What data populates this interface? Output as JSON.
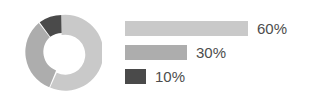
{
  "chart_data": {
    "type": "pie",
    "title": "",
    "subtitle": "",
    "variant": "donut",
    "categories": [
      "60%",
      "30%",
      "10%"
    ],
    "values": [
      60,
      30,
      10
    ],
    "labels": [
      "60%",
      "30%",
      "10%"
    ],
    "colors": [
      "#c9c9c9",
      "#adadad",
      "#4a4a4a"
    ],
    "legend_position": "right",
    "legend_style": "proportional-bars",
    "grid": false,
    "xlabel": "",
    "ylabel": "",
    "slice_gap": true,
    "gap_color": "#ffffff",
    "inner_radius_ratio": 0.52,
    "start_angle_deg": 0,
    "direction": "counterclockwise"
  },
  "figure": {
    "background": "#ffffff",
    "donut": {
      "center_x": 40,
      "center_y": 40,
      "outer_radius": 38,
      "inner_radius": 20,
      "slices": [
        {
          "name": "slice-60",
          "value": 60,
          "label": "60%",
          "color": "#c9c9c9"
        },
        {
          "name": "slice-30",
          "value": 30,
          "label": "30%",
          "color": "#adadad"
        },
        {
          "name": "slice-10",
          "value": 10,
          "label": "10%",
          "color": "#4a4a4a"
        }
      ]
    },
    "legend": {
      "max_bar_width": 123,
      "rows": [
        {
          "label": "60%",
          "value": 60,
          "bar_width": 123,
          "color": "#c9c9c9"
        },
        {
          "label": "30%",
          "value": 30,
          "bar_width": 62,
          "color": "#adadad"
        },
        {
          "label": "10%",
          "value": 10,
          "bar_width": 21,
          "color": "#4a4a4a"
        }
      ]
    },
    "text_color": "#4d4d4d"
  }
}
